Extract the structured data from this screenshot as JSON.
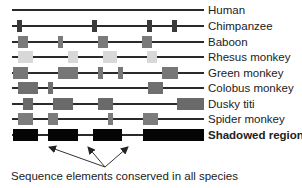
{
  "diagram": {
    "caption": "Sequence elements conserved in all species",
    "rows": [
      {
        "label": "Human",
        "y": 4,
        "color": "#2a2a2a",
        "line": [
          12,
          204
        ],
        "boxes": [],
        "legend_box": false,
        "bold": false
      },
      {
        "label": "Chimpanzee",
        "y": 20,
        "color": "#3a3a3a",
        "line": [
          12,
          204
        ],
        "boxes": [
          [
            17,
            5
          ],
          [
            92,
            5
          ],
          [
            147,
            5
          ],
          [
            172,
            5
          ]
        ],
        "legend_box": false,
        "bold": false
      },
      {
        "label": "Baboon",
        "y": 36,
        "color": "#7a7a7a",
        "line": [
          12,
          204
        ],
        "boxes": [
          [
            18,
            10
          ],
          [
            58,
            5
          ],
          [
            98,
            10
          ],
          [
            142,
            10
          ]
        ],
        "legend_box": false,
        "bold": false
      },
      {
        "label": "Rhesus monkey",
        "y": 51,
        "color": "#d8d8d8",
        "line": [
          12,
          204
        ],
        "boxes": [
          [
            18,
            15
          ],
          [
            68,
            10
          ],
          [
            103,
            14
          ],
          [
            147,
            10
          ]
        ],
        "legend_box": false,
        "bold": false
      },
      {
        "label": "Green monkey",
        "y": 67,
        "color": "#777777",
        "line": [
          12,
          204
        ],
        "boxes": [
          [
            13,
            15
          ],
          [
            58,
            20
          ],
          [
            98,
            5
          ],
          [
            118,
            5
          ],
          [
            162,
            16
          ]
        ],
        "legend_box": false,
        "bold": false
      },
      {
        "label": "Colobus monkey",
        "y": 82,
        "color": "#6f6f6f",
        "line": [
          12,
          204
        ],
        "boxes": [
          [
            18,
            20
          ],
          [
            48,
            5
          ],
          [
            148,
            15
          ]
        ],
        "legend_box": false,
        "bold": false
      },
      {
        "label": "Dusky titi",
        "y": 98,
        "color": "#6a6a6a",
        "line": [
          12,
          204
        ],
        "boxes": [
          [
            23,
            10
          ],
          [
            53,
            20
          ],
          [
            98,
            15
          ],
          [
            177,
            20
          ]
        ],
        "legend_box": true,
        "bold": false
      },
      {
        "label": "Spider monkey",
        "y": 113,
        "color": "#7c7c7c",
        "line": [
          12,
          204
        ],
        "boxes": [
          [
            18,
            15
          ],
          [
            48,
            10
          ],
          [
            108,
            5
          ],
          [
            143,
            15
          ]
        ],
        "legend_box": false,
        "bold": false
      },
      {
        "label": "Shadowed regions",
        "y": 129,
        "color": "#050505",
        "line": [
          12,
          204
        ],
        "boxes": [
          [
            13,
            25
          ],
          [
            48,
            30
          ],
          [
            93,
            29
          ],
          [
            143,
            54
          ]
        ],
        "legend_box": true,
        "bold": true
      }
    ],
    "arrows": {
      "origin": [
        105,
        167
      ],
      "targets": [
        [
          49,
          147
        ],
        [
          88,
          147
        ],
        [
          128,
          147
        ]
      ]
    }
  }
}
